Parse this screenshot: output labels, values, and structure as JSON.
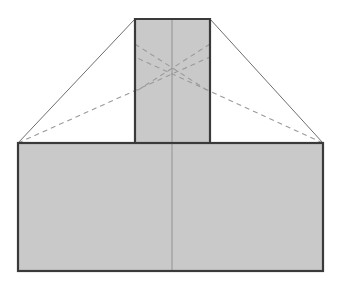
{
  "figure": {
    "title": "",
    "canvas": {
      "width": 341,
      "height": 285,
      "background": "#ffffff"
    },
    "colors": {
      "fill": "#c9c9c9",
      "fill_light": "#cfcfcf",
      "stroke": "#3a3a3a",
      "stroke_thin": "#8c8c8c",
      "dashed": "#9a9a9a",
      "background": "#ffffff"
    },
    "strokes": {
      "outline_width": 2.2,
      "thin_width": 0.9,
      "dashed_width": 1.1,
      "dash_pattern": "5,4"
    },
    "shapes": [
      {
        "name": "base-rectangle",
        "type": "rect",
        "x": 18,
        "y": 143,
        "width": 305,
        "height": 128,
        "fill": "#c9c9c9",
        "stroke": "#3a3a3a"
      },
      {
        "name": "center-column",
        "type": "rect",
        "x": 135,
        "y": 19,
        "width": 75,
        "height": 124,
        "fill": "#c9c9c9",
        "stroke": "#3a3a3a"
      }
    ],
    "lines": [
      {
        "name": "roof-line-left",
        "style": "solid-thin",
        "x1": 18,
        "y1": 143,
        "x2": 135,
        "y2": 19
      },
      {
        "name": "roof-line-right",
        "style": "solid-thin",
        "x1": 323,
        "y1": 143,
        "x2": 210,
        "y2": 19
      },
      {
        "name": "center-vertical-axis",
        "style": "solid-thin",
        "x1": 172,
        "y1": 19,
        "x2": 172,
        "y2": 271
      },
      {
        "name": "diagonal-left-lower",
        "style": "dashed",
        "x1": 18,
        "y1": 143,
        "x2": 210,
        "y2": 57
      },
      {
        "name": "diagonal-right-lower",
        "style": "dashed",
        "x1": 323,
        "y1": 143,
        "x2": 135,
        "y2": 57
      },
      {
        "name": "diagonal-left-upper",
        "style": "dashed",
        "x1": 135,
        "y1": 44,
        "x2": 210,
        "y2": 92
      },
      {
        "name": "diagonal-right-upper",
        "style": "dashed",
        "x1": 210,
        "y1": 44,
        "x2": 135,
        "y2": 92
      }
    ],
    "labels": []
  }
}
